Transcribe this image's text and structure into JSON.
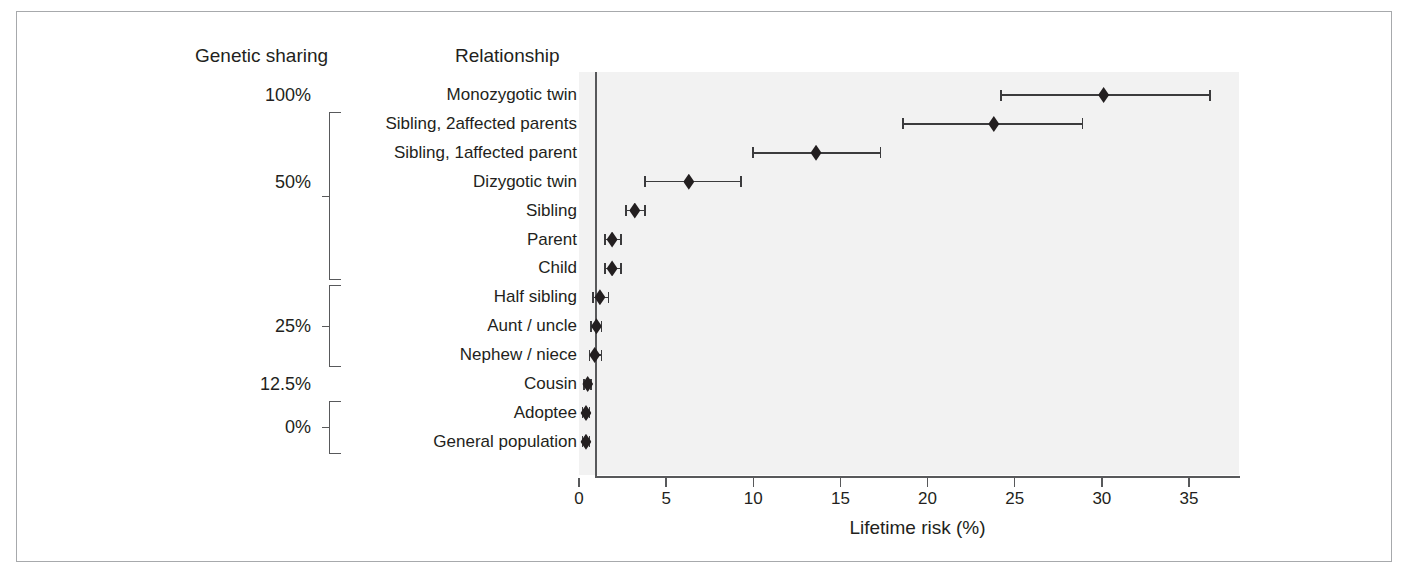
{
  "figure": {
    "columns": {
      "genetic_sharing": "Genetic sharing",
      "relationship": "Relationship"
    }
  },
  "chart_data": {
    "type": "scatter",
    "title": "",
    "xlabel": "Lifetime risk (%)",
    "ylabel": "",
    "xlim": [
      0,
      37.5
    ],
    "xticks": [
      0,
      5,
      10,
      15,
      20,
      25,
      30,
      35
    ],
    "xtick_labels": [
      "0",
      "5",
      "10",
      "15",
      "20",
      "25",
      "30",
      "35"
    ],
    "grid": false,
    "legend": "none",
    "plot_background": "#f2f2f2",
    "marker_color": "#231f20",
    "categories": [
      "Monozygotic twin",
      "Sibling, 2affected parents",
      "Sibling, 1affected parent",
      "Dizygotic twin",
      "Sibling",
      "Parent",
      "Child",
      "Half sibling",
      "Aunt / uncle",
      "Nephew / niece",
      "Cousin",
      "Adoptee",
      "General population"
    ],
    "values": [
      30.1,
      23.8,
      13.6,
      6.3,
      3.2,
      1.9,
      1.9,
      1.2,
      1.0,
      0.9,
      0.5,
      0.4,
      0.4
    ],
    "ci_low": [
      24.2,
      18.6,
      10.0,
      3.8,
      2.7,
      1.5,
      1.5,
      0.8,
      0.7,
      0.6,
      0.3,
      0.2,
      0.2
    ],
    "ci_high": [
      36.2,
      28.9,
      17.3,
      9.3,
      3.8,
      2.4,
      2.4,
      1.7,
      1.3,
      1.3,
      0.7,
      0.6,
      0.6
    ],
    "genetic_sharing": [
      "100%",
      "50%",
      "50%",
      "50%",
      "50%",
      "50%",
      "50%",
      "25%",
      "25%",
      "25%",
      "12.5%",
      "0%",
      "0%"
    ]
  },
  "genetic_sharing_labels": [
    {
      "text": "100%",
      "row": 0
    },
    {
      "text": "50%",
      "row": 3
    },
    {
      "text": "25%",
      "row": 8
    },
    {
      "text": "12.5%",
      "row": 10
    },
    {
      "text": "0%",
      "row": 11.5
    }
  ],
  "brackets": [
    {
      "name": "bracket-50-percent",
      "first_row": 1,
      "last_row": 6
    },
    {
      "name": "bracket-25-percent",
      "first_row": 7,
      "last_row": 9
    },
    {
      "name": "bracket-0-percent",
      "first_row": 11,
      "last_row": 12
    }
  ]
}
